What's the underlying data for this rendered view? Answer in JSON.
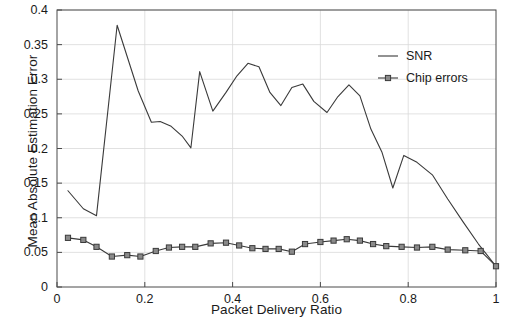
{
  "chart_data": {
    "type": "line",
    "title": "",
    "xlabel": "Packet Delivery Ratio",
    "ylabel": "Mean Absolute Estimation Error",
    "xlim": [
      0,
      1
    ],
    "ylim": [
      0,
      0.4
    ],
    "grid": true,
    "legend_position": "upper-right",
    "xticks": [
      "0",
      "0.2",
      "0.4",
      "0.6",
      "0.8",
      "1"
    ],
    "xtick_values": [
      0,
      0.2,
      0.4,
      0.6,
      0.8,
      1
    ],
    "yticks": [
      "0",
      "0.05",
      "0.1",
      "0.15",
      "0.2",
      "0.25",
      "0.3",
      "0.35",
      "0.4"
    ],
    "ytick_values": [
      0,
      0.05,
      0.1,
      0.15,
      0.2,
      0.25,
      0.3,
      0.35,
      0.4
    ],
    "line_color": "#3a3a3a",
    "series": [
      {
        "name": "SNR",
        "marker": "none",
        "x": [
          0.025,
          0.06,
          0.09,
          0.137,
          0.185,
          0.215,
          0.235,
          0.26,
          0.285,
          0.305,
          0.325,
          0.355,
          0.385,
          0.41,
          0.435,
          0.46,
          0.485,
          0.51,
          0.535,
          0.56,
          0.585,
          0.615,
          0.64,
          0.665,
          0.69,
          0.715,
          0.74,
          0.765,
          0.79,
          0.82,
          0.855,
          0.89,
          0.925,
          0.96,
          1.0
        ],
        "y": [
          0.139,
          0.113,
          0.103,
          0.378,
          0.283,
          0.238,
          0.239,
          0.232,
          0.218,
          0.201,
          0.311,
          0.254,
          0.281,
          0.305,
          0.323,
          0.318,
          0.281,
          0.262,
          0.288,
          0.293,
          0.268,
          0.252,
          0.275,
          0.292,
          0.276,
          0.228,
          0.195,
          0.143,
          0.19,
          0.18,
          0.162,
          0.127,
          0.094,
          0.062,
          0.03
        ]
      },
      {
        "name": "Chip errors",
        "marker": "square",
        "x": [
          0.025,
          0.06,
          0.09,
          0.125,
          0.16,
          0.19,
          0.225,
          0.255,
          0.285,
          0.315,
          0.35,
          0.385,
          0.415,
          0.445,
          0.475,
          0.505,
          0.535,
          0.565,
          0.6,
          0.63,
          0.66,
          0.69,
          0.72,
          0.75,
          0.785,
          0.82,
          0.855,
          0.89,
          0.93,
          0.965,
          1.0
        ],
        "y": [
          0.071,
          0.068,
          0.058,
          0.044,
          0.046,
          0.044,
          0.052,
          0.057,
          0.058,
          0.058,
          0.063,
          0.064,
          0.06,
          0.056,
          0.055,
          0.055,
          0.051,
          0.062,
          0.065,
          0.067,
          0.069,
          0.067,
          0.062,
          0.059,
          0.058,
          0.057,
          0.058,
          0.054,
          0.053,
          0.052,
          0.03
        ]
      }
    ],
    "legend": [
      {
        "label": "SNR",
        "marker": "none"
      },
      {
        "label": "Chip errors",
        "marker": "square"
      }
    ]
  }
}
